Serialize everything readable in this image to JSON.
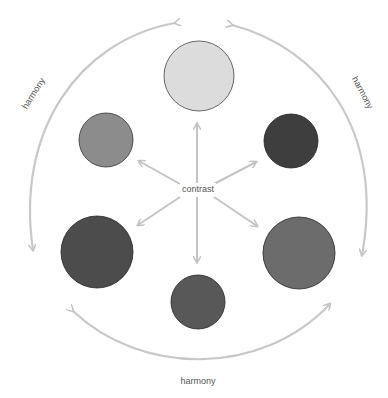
{
  "diagram": {
    "center_label": "contrast",
    "harmony_labels": {
      "left": "harmony",
      "right": "harmony",
      "bottom": "harmony"
    },
    "circles": [
      {
        "id": "top",
        "cx": 199,
        "cy": 76,
        "r": 35,
        "fill": "#dcdcdc"
      },
      {
        "id": "upper-left",
        "cx": 106,
        "cy": 140,
        "r": 27,
        "fill": "#8c8c8c"
      },
      {
        "id": "upper-right",
        "cx": 291,
        "cy": 141,
        "r": 27,
        "fill": "#3e3e3e"
      },
      {
        "id": "lower-left",
        "cx": 97,
        "cy": 252,
        "r": 36,
        "fill": "#4c4c4c"
      },
      {
        "id": "lower-right",
        "cx": 299,
        "cy": 253,
        "r": 36,
        "fill": "#6c6c6c"
      },
      {
        "id": "bottom",
        "cx": 198,
        "cy": 302,
        "r": 27,
        "fill": "#585858"
      }
    ],
    "colors": {
      "arrow": "#c4c4c4",
      "outline": "#333333"
    }
  }
}
